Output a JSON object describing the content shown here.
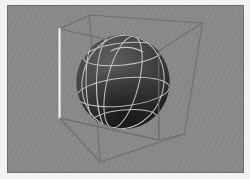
{
  "viewport": {
    "title": "3D Viewport",
    "width": 250,
    "height": 179,
    "frame_color": "#f2f2f0",
    "border_color": "#6e6e6e",
    "background_color": "#8a8a8a",
    "background_style": "noisy-gray",
    "projection": "perspective"
  },
  "scene": {
    "name": "Sphere in bounding box",
    "objects": [
      {
        "name": "bounding-cube",
        "type": "wireframe-box",
        "edge_color": "#6b6b6b",
        "highlight_edge_color": "#f5f5f5",
        "highlight_edge": "front-left-vertical",
        "vertices": {
          "front_top_left": [
            64,
            30
          ],
          "front_top_right": [
            163,
            52
          ],
          "front_bottom_left": [
            64,
            120
          ],
          "front_bottom_right": [
            163,
            142
          ],
          "back_top_left": [
            94,
            17
          ],
          "back_top_right": [
            207,
            25
          ],
          "back_bottom_left": [
            105,
            163
          ],
          "back_bottom_right": [
            190,
            135
          ]
        }
      },
      {
        "name": "sphere",
        "type": "shaded-sphere",
        "center": [
          129,
          85
        ],
        "radius": 48,
        "surface_color": "#3a3a3a",
        "shadow_color": "#0d0d0d",
        "highlight_color": "#545454",
        "wireframe_color": "#cfcfcf",
        "meridians": 4,
        "parallels": 3,
        "shading": "diffuse-top-left-light"
      }
    ],
    "light": {
      "name": "key-light",
      "direction": "upper-left",
      "intensity_label": "1.0"
    }
  },
  "annotations": {
    "alt_text": "A dark grey shaded sphere with light wireframe meridians and parallels, enclosed in a grey wireframe bounding cube, rendered on a grainy grey background."
  }
}
